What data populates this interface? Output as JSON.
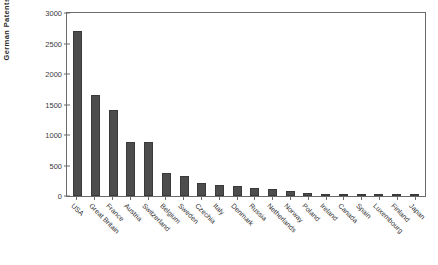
{
  "chart_data": {
    "type": "bar",
    "title": "",
    "xlabel": "",
    "ylabel": "German  Patents",
    "ylim": [
      0,
      3000
    ],
    "ytick_labels": [
      "3000",
      "2500",
      "2000",
      "1500",
      "1000",
      "500",
      "0"
    ],
    "ytick_values": [
      3000,
      2500,
      2000,
      1500,
      1000,
      500,
      0
    ],
    "grid": false,
    "legend": null,
    "bar_color": "#4d4d4d",
    "categories": [
      "USA",
      "Great Britain",
      "France",
      "Austria",
      "Switzerland",
      "Belgium",
      "Sweden",
      "Czechia",
      "Italy",
      "Denmark",
      "Russia",
      "Netherlands",
      "Norway",
      "Poland",
      "Ireland",
      "Canada",
      "Spain",
      "Luxembourg",
      "Finland",
      "Japan"
    ],
    "values": [
      2700,
      1660,
      1410,
      890,
      890,
      370,
      320,
      210,
      175,
      165,
      125,
      115,
      75,
      45,
      40,
      38,
      35,
      30,
      18,
      15
    ]
  }
}
